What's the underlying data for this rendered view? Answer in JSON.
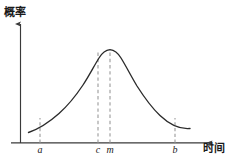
{
  "figure": {
    "name": "probability-vs-time-bell-curve",
    "background_color": "#ffffff",
    "curve_color": "#2b2b2b",
    "axis_color": "#3a3a3a",
    "dashed_color": "#9a9a9a"
  },
  "axes": {
    "y_title": "概率",
    "x_title": "时间"
  },
  "ticks": [
    {
      "label": "a",
      "x": 40
    },
    {
      "label": "c",
      "x": 98
    },
    {
      "label": "m",
      "x": 110
    },
    {
      "label": "b",
      "x": 175
    }
  ],
  "chart_data": {
    "type": "line",
    "title": "",
    "subtitle": "",
    "xlabel": "时间",
    "ylabel": "概率",
    "grid": false,
    "legend": null,
    "axis_arrows": true,
    "xlim": [
      12,
      215
    ],
    "ylim": [
      0,
      100
    ],
    "curve_shape": "bell",
    "annotations": [
      {
        "label": "a",
        "type": "dashed-vertical",
        "note": "lower bound marker, short dashed segment from axis up to curve"
      },
      {
        "label": "c",
        "type": "dashed-vertical",
        "note": "dashed vertical from axis up to curve near peak"
      },
      {
        "label": "m",
        "type": "dashed-vertical",
        "note": "dashed vertical at mode / peak of curve"
      },
      {
        "label": "b",
        "type": "dashed-vertical",
        "note": "upper bound marker, short dashed segment from axis up to curve"
      }
    ],
    "x": [
      28,
      36,
      44,
      52,
      60,
      68,
      76,
      84,
      92,
      98,
      104,
      110,
      116,
      124,
      132,
      140,
      148,
      156,
      164,
      172,
      180,
      190
    ],
    "y": [
      11,
      16,
      22,
      29,
      38,
      49,
      61,
      74,
      86,
      93,
      97,
      99,
      98,
      93,
      83,
      70,
      56,
      44,
      33,
      25,
      19,
      15
    ],
    "points": [
      {
        "x": 28,
        "y": 11
      },
      {
        "x": 40,
        "y": 18
      },
      {
        "x": 52,
        "y": 29
      },
      {
        "x": 64,
        "y": 43
      },
      {
        "x": 76,
        "y": 61
      },
      {
        "x": 88,
        "y": 81
      },
      {
        "x": 98,
        "y": 93
      },
      {
        "x": 110,
        "y": 99
      },
      {
        "x": 122,
        "y": 95
      },
      {
        "x": 134,
        "y": 82
      },
      {
        "x": 146,
        "y": 64
      },
      {
        "x": 158,
        "y": 47
      },
      {
        "x": 170,
        "y": 32
      },
      {
        "x": 180,
        "y": 22
      },
      {
        "x": 190,
        "y": 15
      }
    ]
  }
}
